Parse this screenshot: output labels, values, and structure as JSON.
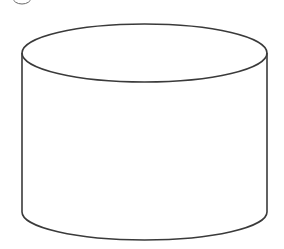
{
  "figure": {
    "shape": "cylinder",
    "label_marker": "circled-number-partial",
    "stroke_color": "#3a3a3a",
    "fill_color": "#ffffff"
  }
}
